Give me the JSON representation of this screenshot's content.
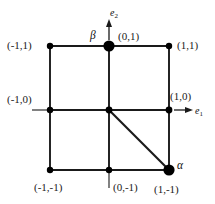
{
  "figure": {
    "title": "",
    "background_color": "#ffffff",
    "line_color": "#1a1a1a",
    "node_color": "#000000"
  },
  "axes": {
    "e1": {
      "label": "e",
      "subscript": "1",
      "direction": "right",
      "origin_vertex": "(1,0)"
    },
    "e2": {
      "label": "e",
      "subscript": "2",
      "direction": "up",
      "origin_vertex": "(0,1)"
    }
  },
  "nodes": [
    {
      "id": "n-m1-1",
      "label": "(-1,1)",
      "x": -1,
      "y": 1,
      "size": "small",
      "marker": null
    },
    {
      "id": "n-0-1",
      "label": "(0,1)",
      "x": 0,
      "y": 1,
      "size": "large",
      "marker": "β"
    },
    {
      "id": "n-1-1",
      "label": "(1,1)",
      "x": 1,
      "y": 1,
      "size": "small",
      "marker": null
    },
    {
      "id": "n-m1-0",
      "label": "(-1,0)",
      "x": -1,
      "y": 0,
      "size": "small",
      "marker": null
    },
    {
      "id": "n-0-0",
      "label": "",
      "x": 0,
      "y": 0,
      "size": "small",
      "marker": null
    },
    {
      "id": "n-1-0",
      "label": "(1,0)",
      "x": 1,
      "y": 0,
      "size": "small",
      "marker": null
    },
    {
      "id": "n-m1-m1",
      "label": "(-1,-1)",
      "x": -1,
      "y": -1,
      "size": "small",
      "marker": null
    },
    {
      "id": "n-0-m1",
      "label": "(0,-1)",
      "x": 0,
      "y": -1,
      "size": "small",
      "marker": null
    },
    {
      "id": "n-1-m1",
      "label": "(1,-1)",
      "x": 1,
      "y": -1,
      "size": "large",
      "marker": "α"
    }
  ],
  "markers": {
    "alpha": "α",
    "beta": "β"
  },
  "labels": {
    "top_left": "(-1,1)",
    "top_center": "(0,1)",
    "top_right": "(1,1)",
    "mid_left": "(-1,0)",
    "mid_right": "(1,0)",
    "bottom_left": "(-1,-1)",
    "bottom_center": "(0,-1)",
    "bottom_right": "(1,-1)"
  },
  "edges": {
    "grid": [
      [
        "(-1,1)",
        "(0,1)"
      ],
      [
        "(0,1)",
        "(1,1)"
      ],
      [
        "(-1,0)",
        "(0,0)"
      ],
      [
        "(0,0)",
        "(1,0)"
      ],
      [
        "(-1,-1)",
        "(0,-1)"
      ],
      [
        "(0,-1)",
        "(1,-1)"
      ],
      [
        "(-1,1)",
        "(-1,0)"
      ],
      [
        "(-1,0)",
        "(-1,-1)"
      ],
      [
        "(0,1)",
        "(0,0)"
      ],
      [
        "(0,0)",
        "(0,-1)"
      ],
      [
        "(1,1)",
        "(1,0)"
      ],
      [
        "(1,0)",
        "(1,-1)"
      ]
    ],
    "diagonal": [
      [
        "(0,0)",
        "(1,-1)"
      ]
    ]
  }
}
